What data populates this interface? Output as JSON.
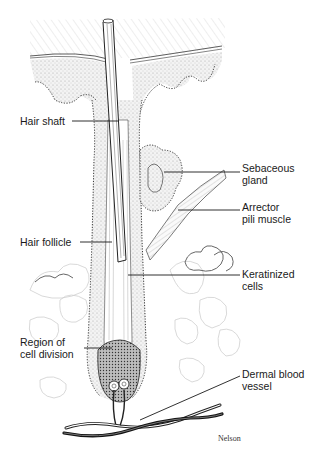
{
  "diagram": {
    "labels": {
      "hair_shaft": "Hair shaft",
      "hair_follicle": "Hair follicle",
      "region_line1": "Region of",
      "region_line2": "cell division",
      "sebaceous_line1": "Sebaceous",
      "sebaceous_line2": "gland",
      "arrector_line1": "Arrector",
      "arrector_line2": "pili muscle",
      "keratinized_line1": "Keratinized",
      "keratinized_line2": "cells",
      "dermal_line1": "Dermal blood",
      "dermal_line2": "vessel"
    },
    "credit": "Nelson",
    "colors": {
      "ink": "#1a1a1a",
      "stipple": "#cfcfcf",
      "epidermis_hatch": "#d8d8d8",
      "fat_outline": "#c8c8c8"
    }
  }
}
